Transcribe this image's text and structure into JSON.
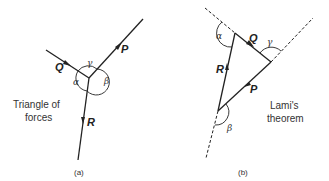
{
  "figure": {
    "panel_a": {
      "caption": "(a)",
      "title_line1": "Triangle of",
      "title_line2": "forces",
      "forces": {
        "P": "P",
        "Q": "Q",
        "R": "R"
      },
      "angles": {
        "alpha": "α",
        "beta": "β",
        "gamma": "γ"
      }
    },
    "panel_b": {
      "caption": "(b)",
      "title_line1": "Lami's",
      "title_line2": "theorem",
      "forces": {
        "P": "P",
        "Q": "Q",
        "R": "R"
      },
      "angles": {
        "alpha": "α",
        "beta": "β",
        "gamma": "γ"
      }
    },
    "colors": {
      "line": "#222222",
      "background": "#ffffff"
    }
  }
}
